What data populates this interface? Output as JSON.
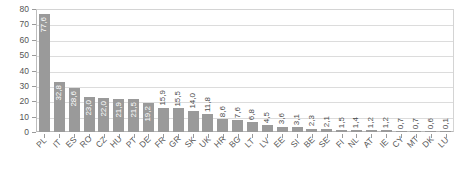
{
  "chart_data": {
    "type": "bar",
    "title": "",
    "subtitle": "",
    "xlabel": "",
    "ylabel": "",
    "ylim": [
      0,
      80
    ],
    "yticks": [
      0,
      10,
      20,
      30,
      40,
      50,
      60,
      70,
      80
    ],
    "ytick_labels": [
      "0",
      "10",
      "20",
      "30",
      "40",
      "50",
      "60",
      "70",
      "80"
    ],
    "grid": "horizontal",
    "legend": "none",
    "bar_color": "#9a9a9a",
    "categories": [
      "PL",
      "IT",
      "ES",
      "RO",
      "CZ",
      "HU",
      "PT",
      "DE",
      "FR",
      "GR",
      "SK",
      "UK",
      "HR",
      "BG",
      "LT",
      "LV",
      "EE",
      "SI",
      "BE",
      "SE",
      "FI",
      "NL",
      "AT",
      "IE",
      "CY",
      "MT",
      "DK",
      "LU"
    ],
    "values": [
      77.6,
      32.8,
      28.6,
      23.0,
      22.0,
      21.9,
      21.5,
      19.2,
      15.9,
      15.5,
      14.0,
      11.8,
      8.6,
      7.6,
      6.8,
      4.5,
      3.6,
      3.1,
      2.3,
      2.1,
      1.5,
      1.4,
      1.2,
      1.2,
      0.7,
      0.7,
      0.6,
      0.1
    ],
    "value_labels": [
      "77,6",
      "32,8",
      "28,6",
      "23,0",
      "22,0",
      "21,9",
      "21,5",
      "19,2",
      "15,9",
      "15,5",
      "14,0",
      "11,8",
      "8,6",
      "7,6",
      "6,8",
      "4,5",
      "3,6",
      "3,1",
      "2,3",
      "2,1",
      "1,5",
      "1,4",
      "1,2",
      "1,2",
      "0,7",
      "0,7",
      "0,6",
      "0,1"
    ]
  }
}
